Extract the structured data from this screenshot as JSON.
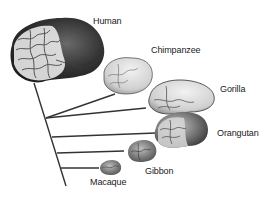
{
  "diagram": {
    "type": "phylogenetic-tree-with-brains",
    "species": [
      {
        "name": "Human",
        "label": "Human"
      },
      {
        "name": "Chimpanzee",
        "label": "Chimpanzee"
      },
      {
        "name": "Gorilla",
        "label": "Gorilla"
      },
      {
        "name": "Orangutan",
        "label": "Orangutan"
      },
      {
        "name": "Gibbon",
        "label": "Gibbon"
      },
      {
        "name": "Macaque",
        "label": "Macaque"
      }
    ],
    "colors": {
      "line": "#333333",
      "brain_dark": "#3a3a3a",
      "brain_mid": "#8a8a8a",
      "brain_light": "#e6e6e6"
    }
  }
}
